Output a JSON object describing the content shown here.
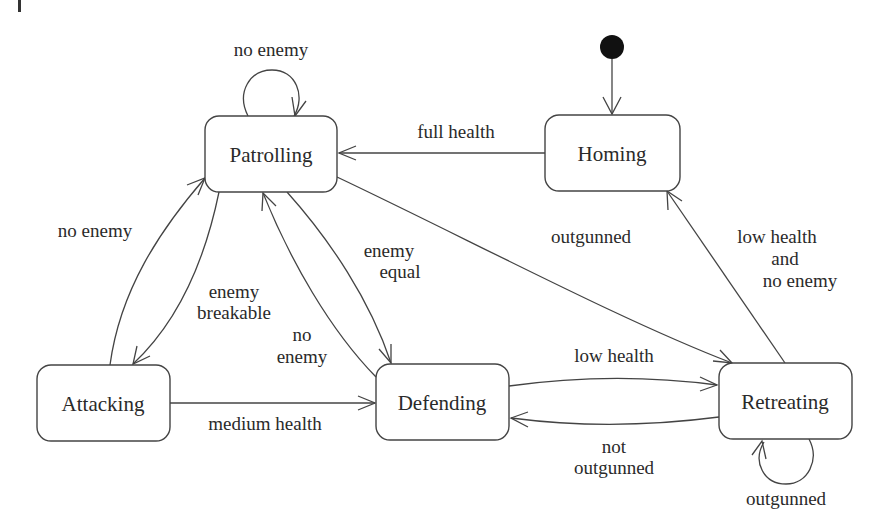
{
  "diagram": {
    "type": "state-machine",
    "initial_state": "Homing",
    "states": {
      "patrolling": {
        "label": "Patrolling"
      },
      "homing": {
        "label": "Homing"
      },
      "attacking": {
        "label": "Attacking"
      },
      "defending": {
        "label": "Defending"
      },
      "retreating": {
        "label": "Retreating"
      }
    },
    "transitions": {
      "patrolling_self": {
        "from": "Patrolling",
        "to": "Patrolling",
        "label": "no enemy"
      },
      "homing_to_patrolling": {
        "from": "Homing",
        "to": "Patrolling",
        "label": "full health"
      },
      "attacking_to_patrolling": {
        "from": "Attacking",
        "to": "Patrolling",
        "label": "no enemy"
      },
      "patrolling_to_attacking": {
        "from": "Patrolling",
        "to": "Attacking",
        "label_line1": "enemy",
        "label_line2": "breakable"
      },
      "defending_to_patrolling": {
        "from": "Defending",
        "to": "Patrolling",
        "label_line1": "no",
        "label_line2": "enemy"
      },
      "patrolling_to_defending": {
        "from": "Patrolling",
        "to": "Defending",
        "label_line1": "enemy",
        "label_line2": "equal"
      },
      "patrolling_to_retreating": {
        "from": "Patrolling",
        "to": "Retreating",
        "label": "outgunned"
      },
      "retreating_to_homing": {
        "from": "Retreating",
        "to": "Homing",
        "label_line1": "low health",
        "label_line2": "and",
        "label_line3": "no enemy"
      },
      "attacking_to_defending": {
        "from": "Attacking",
        "to": "Defending",
        "label": "medium health"
      },
      "defending_to_retreating": {
        "from": "Defending",
        "to": "Retreating",
        "label": "low health"
      },
      "retreating_to_defending": {
        "from": "Retreating",
        "to": "Defending",
        "label_line1": "not",
        "label_line2": "outgunned"
      },
      "retreating_self": {
        "from": "Retreating",
        "to": "Retreating",
        "label": "outgunned"
      }
    }
  }
}
